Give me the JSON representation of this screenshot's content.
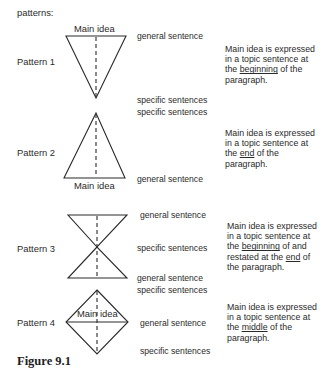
{
  "header": {
    "label": "patterns:"
  },
  "patterns": [
    {
      "name": "Pattern 1",
      "shape": "inverted-triangle",
      "main_idea_label": "Main idea",
      "sentences": [
        "general sentence",
        "specific sentences",
        "specific sentences"
      ],
      "description": {
        "line1": "Main idea is expressed",
        "line2": "in a topic sentence at",
        "line3_pre": "the ",
        "line3_u": "beginning",
        "line3_post": " of the",
        "line4": "paragraph."
      }
    },
    {
      "name": "Pattern 2",
      "shape": "triangle",
      "main_idea_label": "Main idea",
      "sentences": [
        "general sentence"
      ],
      "description": {
        "line1": "Main idea is expressed",
        "line2": "in a topic sentence at",
        "line3_pre": "the ",
        "line3_u": "end",
        "line3_post": " of the",
        "line4": "paragraph."
      }
    },
    {
      "name": "Pattern 3",
      "shape": "hourglass",
      "sentences": [
        "general sentence",
        "specific sentences",
        "general sentence",
        "specific sentences"
      ],
      "description": {
        "line1": "Main idea is expressed",
        "line2": "in a topic sentence at",
        "line3_pre": "the ",
        "line3_u": "beginning",
        "line3_post": " of and",
        "line4_pre": "restated at the ",
        "line4_u": "end",
        "line4_post": " of",
        "line5": "the paragraph."
      }
    },
    {
      "name": "Pattern 4",
      "shape": "diamond",
      "main_idea_label": "Main idea",
      "sentences": [
        "general sentence",
        "specific sentences"
      ],
      "description": {
        "line1": "Main idea is expressed",
        "line2": "in a topic sentence at",
        "line3_pre": "the ",
        "line3_u": "middle",
        "line3_post": " of the",
        "line4": "paragraph."
      }
    }
  ],
  "caption": "Figure 9.1",
  "colors": {
    "ink": "#2a2a2a",
    "background": "#ffffff"
  }
}
